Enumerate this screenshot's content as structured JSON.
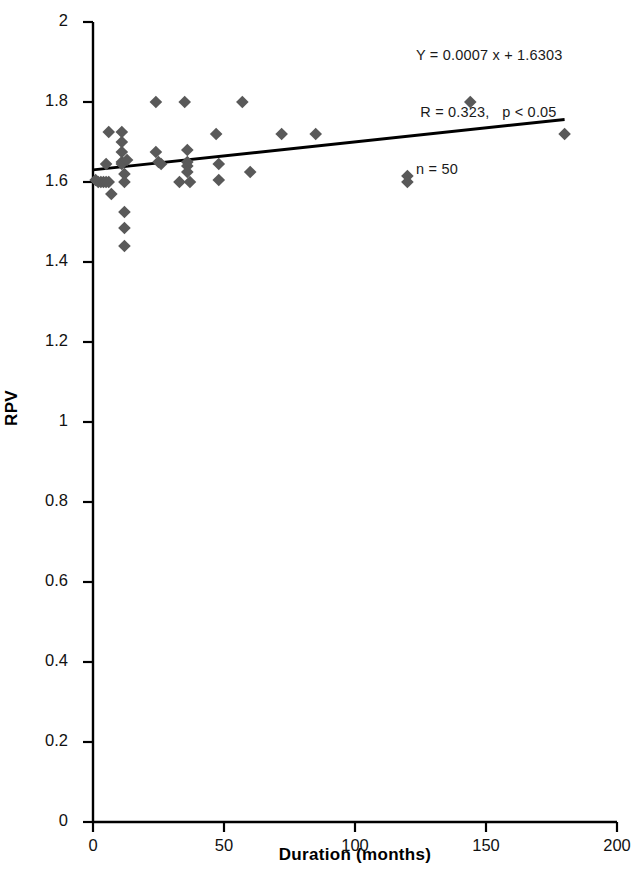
{
  "chart_data": {
    "type": "scatter",
    "title": "",
    "xlabel": "Duration (months)",
    "ylabel": "RPV",
    "xlim": [
      0,
      200
    ],
    "ylim": [
      0,
      2
    ],
    "xticks": [
      0,
      50,
      100,
      150,
      200
    ],
    "yticks": [
      0,
      0.2,
      0.4,
      0.6,
      0.8,
      1,
      1.2,
      1.4,
      1.6,
      1.8,
      2
    ],
    "xtick_labels": [
      "0",
      "50",
      "100",
      "150",
      "200"
    ],
    "ytick_labels": [
      "0",
      "0.2",
      "0.4",
      "0.6",
      "0.8",
      "1",
      "1.2",
      "1.4",
      "1.6",
      "1.8",
      "2"
    ],
    "grid": false,
    "legend": false,
    "marker": "diamond",
    "marker_color": "#595959",
    "marker_size": 9,
    "series": [
      {
        "name": "RPV observations",
        "points": [
          [
            1,
            1.605
          ],
          [
            2,
            1.6
          ],
          [
            3,
            1.6
          ],
          [
            4,
            1.6
          ],
          [
            5,
            1.6
          ],
          [
            5,
            1.645
          ],
          [
            6,
            1.6
          ],
          [
            6,
            1.725
          ],
          [
            7,
            1.57
          ],
          [
            11,
            1.725
          ],
          [
            11,
            1.7
          ],
          [
            11,
            1.675
          ],
          [
            11,
            1.65
          ],
          [
            11,
            1.645
          ],
          [
            12,
            1.62
          ],
          [
            12,
            1.6
          ],
          [
            12,
            1.525
          ],
          [
            12,
            1.485
          ],
          [
            12,
            1.44
          ],
          [
            13,
            1.655
          ],
          [
            24,
            1.8
          ],
          [
            24,
            1.675
          ],
          [
            25,
            1.65
          ],
          [
            26,
            1.645
          ],
          [
            33,
            1.6
          ],
          [
            35,
            1.8
          ],
          [
            36,
            1.68
          ],
          [
            36,
            1.65
          ],
          [
            36,
            1.64
          ],
          [
            36,
            1.625
          ],
          [
            37,
            1.6
          ],
          [
            47,
            1.72
          ],
          [
            48,
            1.645
          ],
          [
            48,
            1.605
          ],
          [
            57,
            1.8
          ],
          [
            60,
            1.625
          ],
          [
            72,
            1.72
          ],
          [
            85,
            1.72
          ],
          [
            120,
            1.615
          ],
          [
            120,
            1.6
          ],
          [
            144,
            1.8
          ],
          [
            180,
            1.72
          ]
        ]
      }
    ],
    "trendline": {
      "equation": "Y = 0.0007 x + 1.6303",
      "slope": 0.0007,
      "intercept": 1.6303,
      "x_start": 0,
      "x_end": 180,
      "color": "#000000"
    },
    "annotations": {
      "line1": "Y = 0.0007 x + 1.6303",
      "line2": " R = 0.323,   p < 0.05",
      "line3": "n = 50",
      "r_value": "0.323",
      "p_value": "p < 0.05",
      "n_value": "n = 50"
    }
  }
}
